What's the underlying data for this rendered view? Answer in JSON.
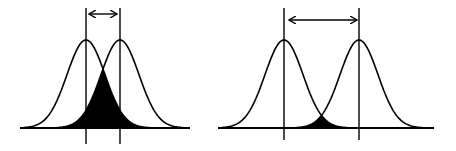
{
  "diagram": {
    "stroke_color": "#000000",
    "fill_color": "#000000",
    "background": "#ffffff",
    "panels": [
      {
        "id": "small-separation",
        "baseline": {
          "x1": 20,
          "x2": 190,
          "y": 128
        },
        "means_px": [
          86,
          120
        ],
        "sigma_px": 19,
        "peak_y": 40,
        "mean_lines": {
          "top": 8,
          "bottom": 144
        },
        "arrow": {
          "x1": 90,
          "x2": 116,
          "y": 14
        },
        "overlap": "large"
      },
      {
        "id": "large-separation",
        "baseline": {
          "x1": 218,
          "x2": 434,
          "y": 128
        },
        "means_px": [
          284,
          359
        ],
        "sigma_px": 19,
        "peak_y": 40,
        "mean_lines": {
          "top": 8,
          "bottom": 140
        },
        "arrow": {
          "x1": 290,
          "x2": 356,
          "y": 20
        },
        "overlap": "small"
      }
    ]
  }
}
